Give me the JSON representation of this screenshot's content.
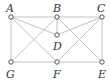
{
  "diagram": {
    "type": "graph",
    "vertices": [
      {
        "id": "A",
        "label": "A",
        "x": 11,
        "y": 17,
        "label_x": 6,
        "label_y": 12
      },
      {
        "id": "B",
        "label": "B",
        "x": 57,
        "y": 17,
        "label_x": 53,
        "label_y": 12
      },
      {
        "id": "C",
        "label": "C",
        "x": 102,
        "y": 17,
        "label_x": 97,
        "label_y": 12
      },
      {
        "id": "D",
        "label": "D",
        "x": 57,
        "y": 35,
        "label_x": 53,
        "label_y": 50
      },
      {
        "id": "G",
        "label": "G",
        "x": 11,
        "y": 62,
        "label_x": 6,
        "label_y": 78
      },
      {
        "id": "F",
        "label": "F",
        "x": 57,
        "y": 62,
        "label_x": 53,
        "label_y": 78
      },
      {
        "id": "E",
        "label": "E",
        "x": 102,
        "y": 62,
        "label_x": 98,
        "label_y": 78
      }
    ],
    "edges": [
      [
        "A",
        "B"
      ],
      [
        "B",
        "C"
      ],
      [
        "A",
        "G"
      ],
      [
        "C",
        "E"
      ],
      [
        "G",
        "F"
      ],
      [
        "F",
        "E"
      ],
      [
        "B",
        "D"
      ],
      [
        "A",
        "D"
      ],
      [
        "C",
        "D"
      ],
      [
        "A",
        "F"
      ],
      [
        "B",
        "G"
      ],
      [
        "B",
        "E"
      ],
      [
        "C",
        "F"
      ]
    ]
  }
}
